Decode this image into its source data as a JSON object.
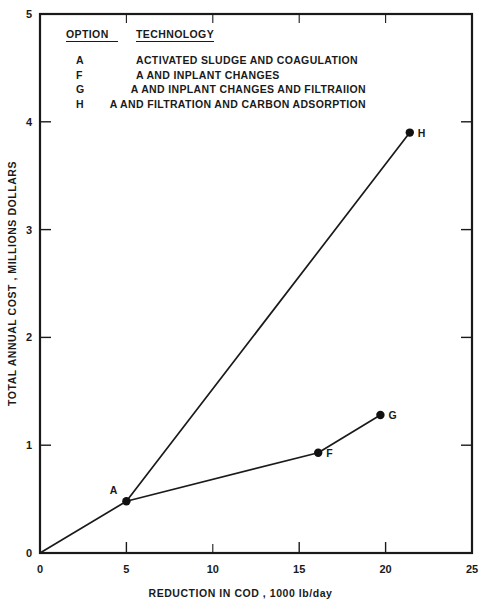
{
  "chart_data": {
    "type": "line",
    "title": "",
    "xlabel": "REDUCTION IN COD , 1000 lb/day",
    "ylabel": "TOTAL ANNUAL COST , MILLIONS DOLLARS",
    "xlim": [
      0,
      25
    ],
    "ylim": [
      0,
      5
    ],
    "xticks": [
      "0",
      "5",
      "10",
      "15",
      "20",
      "25"
    ],
    "xtick_values": [
      0,
      5,
      10,
      15,
      20,
      25
    ],
    "yticks": [
      "0",
      "1",
      "2",
      "3",
      "4",
      "5"
    ],
    "ytick_values": [
      0,
      1,
      2,
      3,
      4,
      5
    ],
    "grid": false,
    "legend_position": "inside-upper-left",
    "series": [
      {
        "name": "upper-branch",
        "points": [
          {
            "label": "",
            "x": 0,
            "y": 0
          },
          {
            "label": "A",
            "x": 5,
            "y": 0.48
          },
          {
            "label": "H",
            "x": 21.4,
            "y": 3.9
          }
        ]
      },
      {
        "name": "lower-branch",
        "points": [
          {
            "label": "A",
            "x": 5,
            "y": 0.48
          },
          {
            "label": "F",
            "x": 16.1,
            "y": 0.93
          },
          {
            "label": "G",
            "x": 19.7,
            "y": 1.28
          }
        ]
      }
    ],
    "annotations": [
      {
        "label": "A",
        "x": 5,
        "y": 0.48
      },
      {
        "label": "F",
        "x": 16.1,
        "y": 0.93
      },
      {
        "label": "G",
        "x": 19.7,
        "y": 1.28
      },
      {
        "label": "H",
        "x": 21.4,
        "y": 3.9
      }
    ]
  },
  "legend": {
    "header": {
      "option": "OPTION",
      "technology": "TECHNOLOGY"
    },
    "rows": [
      {
        "option": "A",
        "technology": "ACTIVATED SLUDGE AND COAGULATION"
      },
      {
        "option": "F",
        "technology": "A AND INPLANT CHANGES"
      },
      {
        "option": "G",
        "technology": "A AND INPLANT CHANGES AND FILTRAIION"
      },
      {
        "option": "H",
        "technology": "A AND FILTRATION AND CARBON ADSORPTION"
      }
    ]
  },
  "colors": {
    "ink": "#1a1a1a",
    "marker": "#111111",
    "background": "#ffffff"
  }
}
